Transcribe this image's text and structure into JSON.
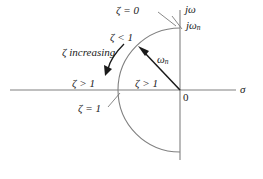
{
  "figure": {
    "type": "s-plane-damping-ratio-diagram",
    "axes": {
      "real_axis_label": "σ",
      "imag_axis_label": "jω",
      "origin_label": "0"
    },
    "labels": {
      "zeta_zero": "ζ = 0",
      "zeta_less_one": "ζ < 1",
      "zeta_increasing": "ζ increasing",
      "zeta_greater_one_left": "ζ > 1",
      "zeta_greater_one_right": "ζ > 1",
      "zeta_equals_one": "ζ = 1",
      "omega_n_vector": "ω",
      "omega_n_vector_sub": "n",
      "j_omega_n": "jω",
      "j_omega_n_sub": "n"
    },
    "colors": {
      "line": "#808080",
      "text": "#1a1a1a",
      "arrow": "#1a1a1a",
      "background": "#ffffff"
    },
    "geometry": {
      "origin_x": 180,
      "origin_y": 90,
      "radius": 62,
      "real_axis_x_start": 10,
      "real_axis_x_end": 236,
      "imag_axis_y_top": 10,
      "imag_axis_y_bottom": 160,
      "vector_tip_x": 140,
      "vector_tip_y": 48
    }
  }
}
